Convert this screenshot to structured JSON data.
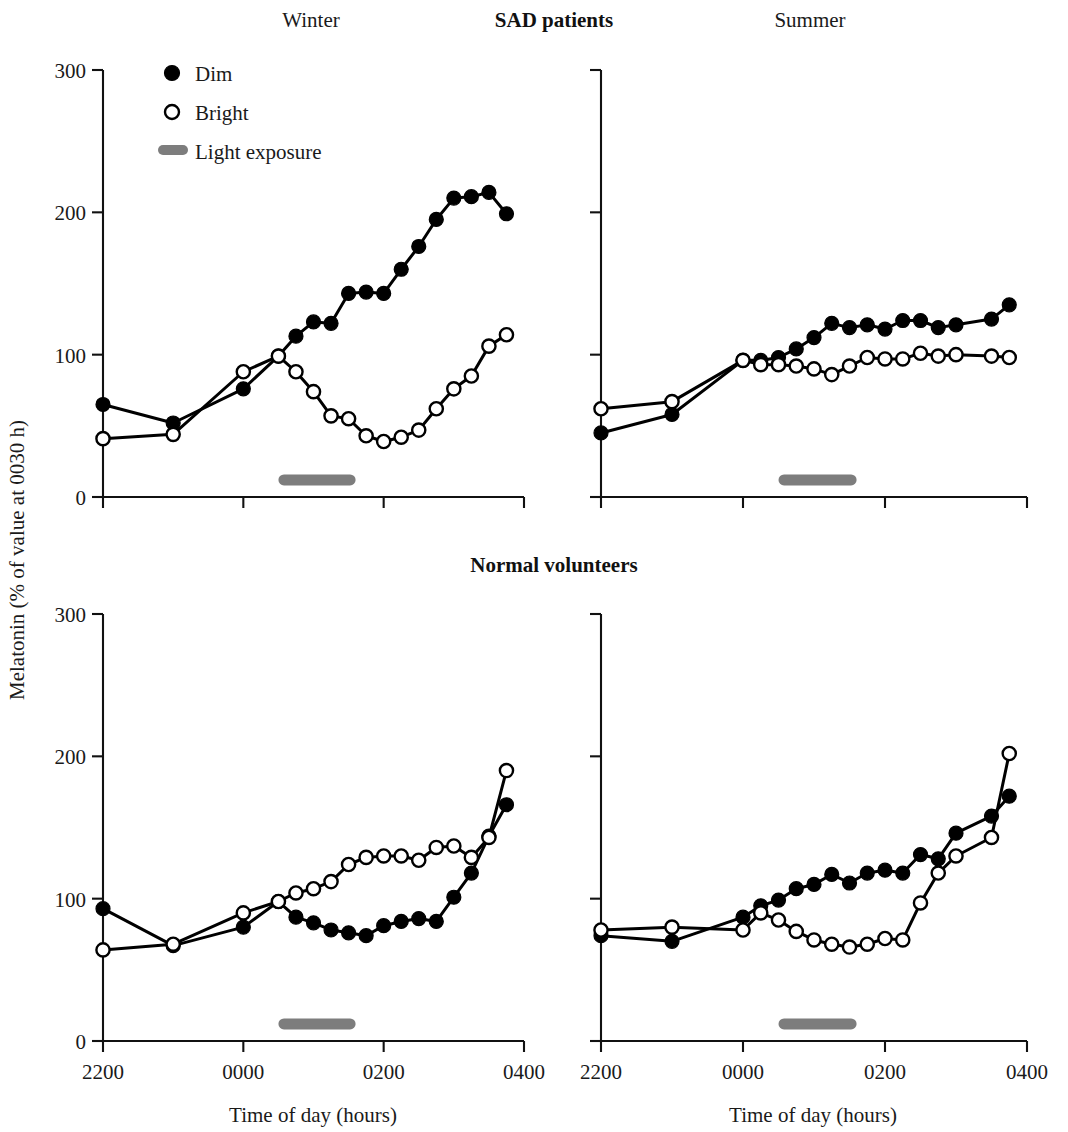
{
  "figure": {
    "y_axis_title": "Melatonin (% of value at 0030 h)",
    "x_axis_title": "Time of day (hours)",
    "group_titles": {
      "top": "SAD patients",
      "bottom": "Normal volunteers"
    },
    "season_titles": {
      "left": "Winter",
      "right": "Summer"
    },
    "legend": {
      "dim_label": "Dim",
      "bright_label": "Bright",
      "light_exposure_label": "Light exposure"
    },
    "colors": {
      "dim_marker": "#000000",
      "bright_marker_fill": "#ffffff",
      "bright_marker_stroke": "#000000",
      "line": "#000000",
      "light_bar": "#7d7d7d",
      "axis": "#111111",
      "background": "#ffffff"
    },
    "y_ticks": [
      "0",
      "100",
      "200",
      "300"
    ],
    "x_ticks": [
      "2200",
      "0000",
      "0200",
      "0400"
    ]
  },
  "chart_data": [
    {
      "id": "sad-winter",
      "type": "line",
      "title": "Winter",
      "group": "SAD patients",
      "panel": "top-left",
      "xlabel": "Time of day (hours)",
      "ylabel": "Melatonin (% of value at 0030 h)",
      "xlim": [
        22.0,
        28.0
      ],
      "ylim": [
        0,
        300
      ],
      "xtick_values": [
        22,
        24,
        26,
        28
      ],
      "xtick_labels": [
        "2200",
        "0000",
        "0200",
        "0400"
      ],
      "ytick_values": [
        0,
        100,
        200,
        300
      ],
      "ytick_labels": [
        "0",
        "100",
        "200",
        "300"
      ],
      "grid": false,
      "legend_position": "top-left",
      "annotations": [
        {
          "label": "Light exposure",
          "type": "hbar",
          "x_start": 24.5,
          "x_end": 25.6,
          "y": 12
        }
      ],
      "series": [
        {
          "name": "Dim",
          "marker": "filled-circle",
          "x": [
            22.0,
            23.0,
            24.0,
            24.5,
            24.75,
            25.0,
            25.25,
            25.5,
            25.75,
            26.0,
            26.25,
            26.5,
            26.75,
            27.0,
            27.25,
            27.5,
            27.75
          ],
          "values": [
            65,
            52,
            76,
            99,
            113,
            123,
            122,
            143,
            144,
            143,
            160,
            176,
            195,
            210,
            211,
            214,
            199
          ]
        },
        {
          "name": "Bright",
          "marker": "open-circle",
          "x": [
            22.0,
            23.0,
            24.0,
            24.5,
            24.75,
            25.0,
            25.25,
            25.5,
            25.75,
            26.0,
            26.25,
            26.5,
            26.75,
            27.0,
            27.25,
            27.5,
            27.75
          ],
          "values": [
            41,
            44,
            88,
            99,
            88,
            74,
            57,
            55,
            43,
            39,
            42,
            47,
            62,
            76,
            85,
            106,
            114
          ]
        }
      ]
    },
    {
      "id": "sad-summer",
      "type": "line",
      "title": "Summer",
      "group": "SAD patients",
      "panel": "top-right",
      "xlabel": "Time of day (hours)",
      "ylabel": "Melatonin (% of value at 0030 h)",
      "xlim": [
        22.0,
        28.0
      ],
      "ylim": [
        0,
        300
      ],
      "xtick_values": [
        22,
        24,
        26,
        28
      ],
      "xtick_labels": [
        "2200",
        "0000",
        "0200",
        "0400"
      ],
      "ytick_values": [
        0,
        100,
        200,
        300
      ],
      "ytick_labels": [
        "0",
        "100",
        "200",
        "300"
      ],
      "grid": false,
      "legend_position": "none",
      "annotations": [
        {
          "label": "Light exposure",
          "type": "hbar",
          "x_start": 24.5,
          "x_end": 25.6,
          "y": 12
        }
      ],
      "series": [
        {
          "name": "Dim",
          "marker": "filled-circle",
          "x": [
            22.0,
            23.0,
            24.0,
            24.25,
            24.5,
            24.75,
            25.0,
            25.25,
            25.5,
            25.75,
            26.0,
            26.25,
            26.5,
            26.75,
            27.0,
            27.5,
            27.75
          ],
          "values": [
            45,
            58,
            96,
            96,
            98,
            104,
            112,
            122,
            119,
            121,
            118,
            124,
            124,
            119,
            121,
            125,
            135
          ]
        },
        {
          "name": "Bright",
          "marker": "open-circle",
          "x": [
            22.0,
            23.0,
            24.0,
            24.25,
            24.5,
            24.75,
            25.0,
            25.25,
            25.5,
            25.75,
            26.0,
            26.25,
            26.5,
            26.75,
            27.0,
            27.5,
            27.75
          ],
          "values": [
            62,
            67,
            96,
            93,
            93,
            92,
            90,
            86,
            92,
            98,
            97,
            97,
            101,
            99,
            100,
            99,
            98
          ]
        }
      ]
    },
    {
      "id": "normal-winter",
      "type": "line",
      "title": "Winter",
      "group": "Normal volunteers",
      "panel": "bottom-left",
      "xlabel": "Time of day (hours)",
      "ylabel": "Melatonin (% of value at 0030 h)",
      "xlim": [
        22.0,
        28.0
      ],
      "ylim": [
        0,
        300
      ],
      "xtick_values": [
        22,
        24,
        26,
        28
      ],
      "xtick_labels": [
        "2200",
        "0000",
        "0200",
        "0400"
      ],
      "ytick_values": [
        0,
        100,
        200,
        300
      ],
      "ytick_labels": [
        "0",
        "100",
        "200",
        "300"
      ],
      "grid": false,
      "legend_position": "none",
      "annotations": [
        {
          "label": "Light exposure",
          "type": "hbar",
          "x_start": 24.5,
          "x_end": 25.6,
          "y": 12
        }
      ],
      "series": [
        {
          "name": "Dim",
          "marker": "filled-circle",
          "x": [
            22.0,
            23.0,
            24.0,
            24.5,
            24.75,
            25.0,
            25.25,
            25.5,
            25.75,
            26.0,
            26.25,
            26.5,
            26.75,
            27.0,
            27.25,
            27.5,
            27.75
          ],
          "values": [
            93,
            67,
            80,
            98,
            87,
            83,
            78,
            76,
            74,
            81,
            84,
            86,
            84,
            101,
            118,
            144,
            166
          ]
        },
        {
          "name": "Bright",
          "marker": "open-circle",
          "x": [
            22.0,
            23.0,
            24.0,
            24.5,
            24.75,
            25.0,
            25.25,
            25.5,
            25.75,
            26.0,
            26.25,
            26.5,
            26.75,
            27.0,
            27.25,
            27.5,
            27.75
          ],
          "values": [
            64,
            68,
            90,
            98,
            104,
            107,
            112,
            124,
            129,
            130,
            130,
            127,
            136,
            137,
            129,
            143,
            190
          ]
        }
      ]
    },
    {
      "id": "normal-summer",
      "type": "line",
      "title": "Summer",
      "group": "Normal volunteers",
      "panel": "bottom-right",
      "xlabel": "Time of day (hours)",
      "ylabel": "Melatonin (% of value at 0030 h)",
      "xlim": [
        22.0,
        28.0
      ],
      "ylim": [
        0,
        300
      ],
      "xtick_values": [
        22,
        24,
        26,
        28
      ],
      "xtick_labels": [
        "2200",
        "0000",
        "0200",
        "0400"
      ],
      "ytick_values": [
        0,
        100,
        200,
        300
      ],
      "ytick_labels": [
        "0",
        "100",
        "200",
        "300"
      ],
      "grid": false,
      "legend_position": "none",
      "annotations": [
        {
          "label": "Light exposure",
          "type": "hbar",
          "x_start": 24.5,
          "x_end": 25.6,
          "y": 12
        }
      ],
      "series": [
        {
          "name": "Dim",
          "marker": "filled-circle",
          "x": [
            22.0,
            23.0,
            24.0,
            24.25,
            24.5,
            24.75,
            25.0,
            25.25,
            25.5,
            25.75,
            26.0,
            26.25,
            26.5,
            26.75,
            27.0,
            27.5,
            27.75
          ],
          "values": [
            74,
            70,
            87,
            95,
            99,
            107,
            110,
            117,
            111,
            118,
            120,
            118,
            131,
            128,
            146,
            158,
            172
          ]
        },
        {
          "name": "Bright",
          "marker": "open-circle",
          "x": [
            22.0,
            23.0,
            24.0,
            24.25,
            24.5,
            24.75,
            25.0,
            25.25,
            25.5,
            25.75,
            26.0,
            26.25,
            26.5,
            26.75,
            27.0,
            27.5,
            27.75
          ],
          "values": [
            78,
            80,
            78,
            90,
            85,
            77,
            71,
            68,
            66,
            68,
            72,
            71,
            97,
            118,
            130,
            143,
            202
          ]
        }
      ]
    }
  ]
}
